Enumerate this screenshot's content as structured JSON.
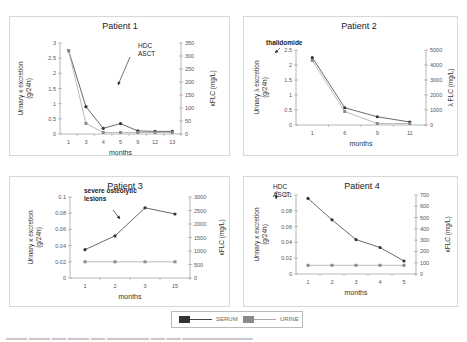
{
  "legend": {
    "serum_label": "SERUM",
    "urine_label": "URINE",
    "serum_color": "#333333",
    "urine_color": "#8a8a8a"
  },
  "chart_data": [
    {
      "type": "line",
      "title": "Patient 1",
      "xlabel": "months",
      "ylabel": "Urinary κ excretion (g/24h)",
      "y2label": "κFLC (mg/L)",
      "categories": [
        "1",
        "3",
        "4",
        "5",
        "9",
        "12",
        "13"
      ],
      "ylim": [
        0,
        3
      ],
      "yticks": [
        "0",
        "0.5",
        "1",
        "1.5",
        "2",
        "2.5",
        "3"
      ],
      "y2lim": [
        0,
        350
      ],
      "y2ticks": [
        "0",
        "50",
        "100",
        "150",
        "200",
        "250",
        "300",
        "350"
      ],
      "annotation": [
        "HDC",
        "ASCT"
      ],
      "series": [
        {
          "name": "SERUM",
          "axis": "right",
          "values": [
            320,
            105,
            22,
            40,
            12,
            10,
            10
          ]
        },
        {
          "name": "URINE",
          "axis": "left",
          "values": [
            2.75,
            0.35,
            0.05,
            0.05,
            0.05,
            0.05,
            0.05
          ]
        }
      ]
    },
    {
      "type": "line",
      "title": "Patient 2",
      "xlabel": "months",
      "ylabel": "Urinary λ excretion (g/24h)",
      "y2label": "λ FLC (mg/L)",
      "categories": [
        "1",
        "6",
        "9",
        "11"
      ],
      "ylim": [
        0,
        2.5
      ],
      "yticks": [
        "0",
        "0.5",
        "1",
        "1.5",
        "2",
        "2.5"
      ],
      "y2lim": [
        0,
        5000
      ],
      "y2ticks": [
        "0",
        "1000",
        "2000",
        "3000",
        "4000",
        "5000"
      ],
      "annotation": [
        "thalidomide"
      ],
      "series": [
        {
          "name": "SERUM",
          "axis": "right",
          "values": [
            4500,
            1150,
            550,
            200
          ]
        },
        {
          "name": "URINE",
          "axis": "left",
          "values": [
            2.15,
            0.45,
            0.05,
            0.05
          ]
        }
      ]
    },
    {
      "type": "line",
      "title": "Patient 3",
      "xlabel": "months",
      "ylabel": "Urinary κ excretion (g/24h)",
      "y2label": "κFLC (mg/L)",
      "categories": [
        "1",
        "2",
        "3",
        "15"
      ],
      "ylim": [
        0,
        0.1
      ],
      "yticks": [
        "0",
        "0.02",
        "0.04",
        "0.06",
        "0.08",
        "0.1"
      ],
      "y2lim": [
        0,
        3000
      ],
      "y2ticks": [
        "0",
        "500",
        "1000",
        "1500",
        "2000",
        "2500",
        "3000"
      ],
      "annotation": [
        "severe osteolytic",
        "lesions"
      ],
      "series": [
        {
          "name": "SERUM",
          "axis": "right",
          "values": [
            1050,
            1560,
            2600,
            2370
          ]
        },
        {
          "name": "URINE",
          "axis": "left",
          "values": [
            0.02,
            0.02,
            0.02,
            0.02
          ]
        }
      ]
    },
    {
      "type": "line",
      "title": "Patient 4",
      "xlabel": "months",
      "ylabel": "Urinary κ excretion (g/24h)",
      "y2label": "κFLC (mg/L)",
      "categories": [
        "1",
        "2",
        "3",
        "4",
        "5"
      ],
      "ylim": [
        0,
        0.1
      ],
      "yticks": [
        "0",
        "0.02",
        "0.04",
        "0.06",
        "0.08",
        "0.1"
      ],
      "y2lim": [
        0,
        700
      ],
      "y2ticks": [
        "0",
        "100",
        "200",
        "300",
        "400",
        "500",
        "600",
        "700"
      ],
      "annotation": [
        "HDC",
        "ASCT"
      ],
      "series": [
        {
          "name": "SERUM",
          "axis": "right",
          "values": [
            670,
            480,
            305,
            235,
            115
          ]
        },
        {
          "name": "URINE",
          "axis": "left",
          "values": [
            0.011,
            0.011,
            0.011,
            0.011,
            0.011
          ]
        }
      ]
    }
  ]
}
